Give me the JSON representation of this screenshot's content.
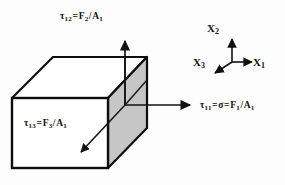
{
  "figure": {
    "colors": {
      "outline": "#0d0d0d",
      "shaded_face": "#c6c6c6",
      "front_face": "#ffffff",
      "top_face": "#ffffff",
      "arrow": "#121212",
      "background": "#fdfdfd",
      "text": "#131313"
    },
    "labels": {
      "tau12": {
        "tau": "τ",
        "tau_sub": "12",
        "eq": "=",
        "force": "F",
        "force_sub": "2",
        "slash": "/",
        "area": "A",
        "area_sub": "1",
        "full": "τ₁₂=F₂/A₁"
      },
      "tau13": {
        "tau": "τ",
        "tau_sub": "13",
        "eq": "=",
        "force": "F",
        "force_sub": "3",
        "slash": "/",
        "area": "A",
        "area_sub": "1",
        "full": "τ₁₃=F₃/A₁"
      },
      "tau11": {
        "tau": "τ",
        "tau_sub": "11",
        "eq1": "=",
        "sigma": "σ",
        "eq2": "=",
        "force": "F",
        "force_sub": "1",
        "slash": "/",
        "area": "A",
        "area_sub": "1",
        "full": "τ₁₁=σ=F₁/A₁"
      }
    },
    "axes": {
      "x1": {
        "name": "X",
        "sub": "1",
        "full": "X1",
        "direction": "right"
      },
      "x2": {
        "name": "X",
        "sub": "2",
        "full": "X2",
        "direction": "up"
      },
      "x3": {
        "name": "X",
        "sub": "3",
        "full": "X3",
        "direction": "down-left"
      }
    }
  }
}
